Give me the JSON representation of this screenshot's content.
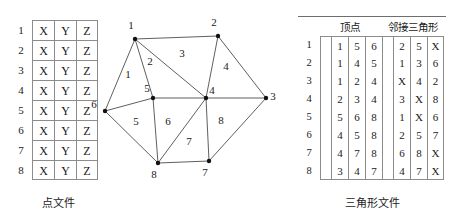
{
  "points_file": {
    "caption": "点文件",
    "columns": [
      "X",
      "Y",
      "Z"
    ],
    "rows": [
      {
        "index": "1",
        "cells": [
          "X",
          "Y",
          "Z"
        ]
      },
      {
        "index": "2",
        "cells": [
          "X",
          "Y",
          "Z"
        ]
      },
      {
        "index": "3",
        "cells": [
          "X",
          "Y",
          "Z"
        ]
      },
      {
        "index": "4",
        "cells": [
          "X",
          "Y",
          "Z"
        ]
      },
      {
        "index": "5",
        "cells": [
          "X",
          "Y",
          "Z"
        ]
      },
      {
        "index": "6",
        "cells": [
          "X",
          "Y",
          "Z"
        ]
      },
      {
        "index": "7",
        "cells": [
          "X",
          "Y",
          "Z"
        ]
      },
      {
        "index": "8",
        "cells": [
          "X",
          "Y",
          "Z"
        ]
      }
    ]
  },
  "triangle_file": {
    "caption": "三角形文件",
    "header_vertex": "顶点",
    "header_adjacent": "邻接三角形",
    "rows": [
      {
        "index": "1",
        "vertices": [
          "1",
          "5",
          "6"
        ],
        "adjacent": [
          "2",
          "5",
          "X"
        ]
      },
      {
        "index": "2",
        "vertices": [
          "1",
          "4",
          "5"
        ],
        "adjacent": [
          "1",
          "3",
          "6"
        ]
      },
      {
        "index": "3",
        "vertices": [
          "1",
          "2",
          "4"
        ],
        "adjacent": [
          "X",
          "4",
          "2"
        ]
      },
      {
        "index": "4",
        "vertices": [
          "2",
          "3",
          "4"
        ],
        "adjacent": [
          "3",
          "X",
          "8"
        ]
      },
      {
        "index": "5",
        "vertices": [
          "5",
          "6",
          "8"
        ],
        "adjacent": [
          "1",
          "X",
          "6"
        ]
      },
      {
        "index": "6",
        "vertices": [
          "4",
          "5",
          "8"
        ],
        "adjacent": [
          "2",
          "5",
          "7"
        ]
      },
      {
        "index": "7",
        "vertices": [
          "4",
          "7",
          "8"
        ],
        "adjacent": [
          "6",
          "8",
          "X"
        ]
      },
      {
        "index": "8",
        "vertices": [
          "3",
          "4",
          "7"
        ],
        "adjacent": [
          "4",
          "7",
          "X"
        ]
      }
    ]
  },
  "mesh": {
    "vertices": [
      {
        "id": "1",
        "x": 45,
        "y": 33,
        "lx": 41,
        "ly": 23
      },
      {
        "id": "2",
        "x": 128,
        "y": 30,
        "lx": 124,
        "ly": 20
      },
      {
        "id": "3",
        "x": 176,
        "y": 92,
        "lx": 183,
        "ly": 94
      },
      {
        "id": "4",
        "x": 116,
        "y": 92,
        "lx": 122,
        "ly": 88
      },
      {
        "id": "5",
        "x": 63,
        "y": 92,
        "lx": 57,
        "ly": 86
      },
      {
        "id": "6",
        "x": 15,
        "y": 105,
        "lx": 4,
        "ly": 102
      },
      {
        "id": "7",
        "x": 119,
        "y": 155,
        "lx": 115,
        "ly": 170
      },
      {
        "id": "8",
        "x": 68,
        "y": 157,
        "lx": 64,
        "ly": 172
      }
    ],
    "edges": [
      [
        "1",
        "2"
      ],
      [
        "1",
        "5"
      ],
      [
        "1",
        "6"
      ],
      [
        "1",
        "4"
      ],
      [
        "2",
        "3"
      ],
      [
        "2",
        "4"
      ],
      [
        "3",
        "4"
      ],
      [
        "3",
        "7"
      ],
      [
        "4",
        "5"
      ],
      [
        "4",
        "7"
      ],
      [
        "4",
        "8"
      ],
      [
        "5",
        "6"
      ],
      [
        "5",
        "8"
      ],
      [
        "6",
        "8"
      ],
      [
        "7",
        "8"
      ]
    ],
    "triangle_labels": [
      {
        "id": "1",
        "x": 38,
        "y": 72
      },
      {
        "id": "2",
        "x": 60,
        "y": 59
      },
      {
        "id": "3",
        "x": 92,
        "y": 51
      },
      {
        "id": "4",
        "x": 136,
        "y": 64
      },
      {
        "id": "5",
        "x": 46,
        "y": 119
      },
      {
        "id": "6",
        "x": 78,
        "y": 119
      },
      {
        "id": "7",
        "x": 99,
        "y": 139
      },
      {
        "id": "8",
        "x": 131,
        "y": 118
      }
    ]
  },
  "colors": {
    "edge": "#4d4d4d",
    "node": "#111111",
    "grid": "#8c8c8c",
    "text": "#1a1a1a"
  }
}
